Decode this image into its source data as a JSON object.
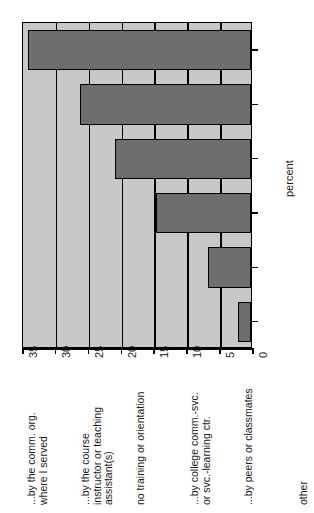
{
  "chart_data": {
    "type": "bar",
    "orientation": "rotated-90",
    "title": "",
    "xlabel": "",
    "ylabel": "percent",
    "ylim": [
      0,
      35
    ],
    "ticks": [
      0,
      5,
      10,
      15,
      20,
      25,
      30,
      35
    ],
    "grid": true,
    "legend": null,
    "categories": [
      "...by the comm. org. where I served",
      "...by the course instructor or teaching assistant(s)",
      "no training or orientation",
      "...by college comm.-svc. or svc.-learning ctr.",
      "...by peers or classmates",
      "other"
    ],
    "category_lines": [
      [
        "...by the comm. org.",
        "where I served"
      ],
      [
        "...by the course",
        "instructor or teaching",
        "assistant(s)"
      ],
      [
        "no training or orientation"
      ],
      [
        "...by college comm.-svc.",
        "or svc.-learning ctr."
      ],
      [
        "...by peers or classmates"
      ],
      [
        "other"
      ]
    ],
    "values": [
      34,
      26,
      20.7,
      14.5,
      6.5,
      2
    ],
    "colors": {
      "bar_fill": "#6e6e6e",
      "bar_stroke": "#000000",
      "plot_background": "#c8c8c8",
      "figure_background": "#ffffff",
      "gridline": "#000000",
      "text": "#1a1a1a"
    }
  }
}
